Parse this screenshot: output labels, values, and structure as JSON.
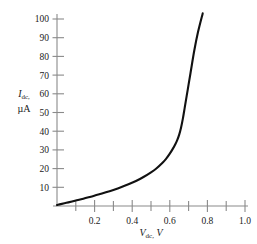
{
  "chart_data": {
    "type": "line",
    "title": "",
    "xlabel": "V_dc, V",
    "xlabel_symbol": "V",
    "xlabel_sub": "dc",
    "xlabel_unit": "V",
    "ylabel_symbol": "I",
    "ylabel_sub": "dc",
    "ylabel_unit": "µA",
    "xlim": [
      0,
      1.0
    ],
    "ylim": [
      0,
      105
    ],
    "grid": false,
    "legend": null,
    "x_major_ticks": [
      0.2,
      0.4,
      0.6,
      0.8,
      1.0
    ],
    "x_major_tick_labels": [
      "0.2",
      "0.4",
      "0.6",
      "0.8",
      "1.0"
    ],
    "x_minor_ticks": [
      0.1,
      0.3,
      0.5,
      0.7,
      0.9
    ],
    "y_major_ticks": [
      10,
      20,
      30,
      40,
      50,
      60,
      70,
      80,
      90,
      100
    ],
    "y_major_tick_labels": [
      "10",
      "20",
      "30",
      "40",
      "50",
      "60",
      "70",
      "80",
      "90",
      "100"
    ],
    "series": [
      {
        "name": "diode I-V characteristic",
        "x": [
          0.0,
          0.02,
          0.05,
          0.08,
          0.1,
          0.14,
          0.18,
          0.22,
          0.26,
          0.3,
          0.34,
          0.38,
          0.42,
          0.46,
          0.5,
          0.53,
          0.56,
          0.58,
          0.6,
          0.615,
          0.63,
          0.64,
          0.65,
          0.66,
          0.67,
          0.68,
          0.695,
          0.71,
          0.73,
          0.75,
          0.775
        ],
        "y": [
          0.5,
          1.0,
          1.7,
          2.4,
          2.9,
          3.9,
          5.0,
          6.1,
          7.3,
          8.6,
          10.0,
          11.6,
          13.4,
          15.5,
          18.0,
          20.2,
          23.0,
          25.2,
          28.0,
          30.4,
          33.2,
          35.4,
          38.2,
          42.0,
          47.0,
          53.0,
          62.0,
          71.0,
          83.0,
          93.0,
          103.0
        ]
      }
    ]
  },
  "axis_labels": {
    "y_line1_symbol": "I",
    "y_line1_sub": "dc,",
    "y_line2": "µA",
    "x_symbol": "V",
    "x_sub": "dc,",
    "x_unit": "V"
  },
  "colors": {
    "curve": "#111111",
    "axis": "#8a8a8a",
    "text": "#1a1a1a",
    "background": "#ffffff"
  }
}
